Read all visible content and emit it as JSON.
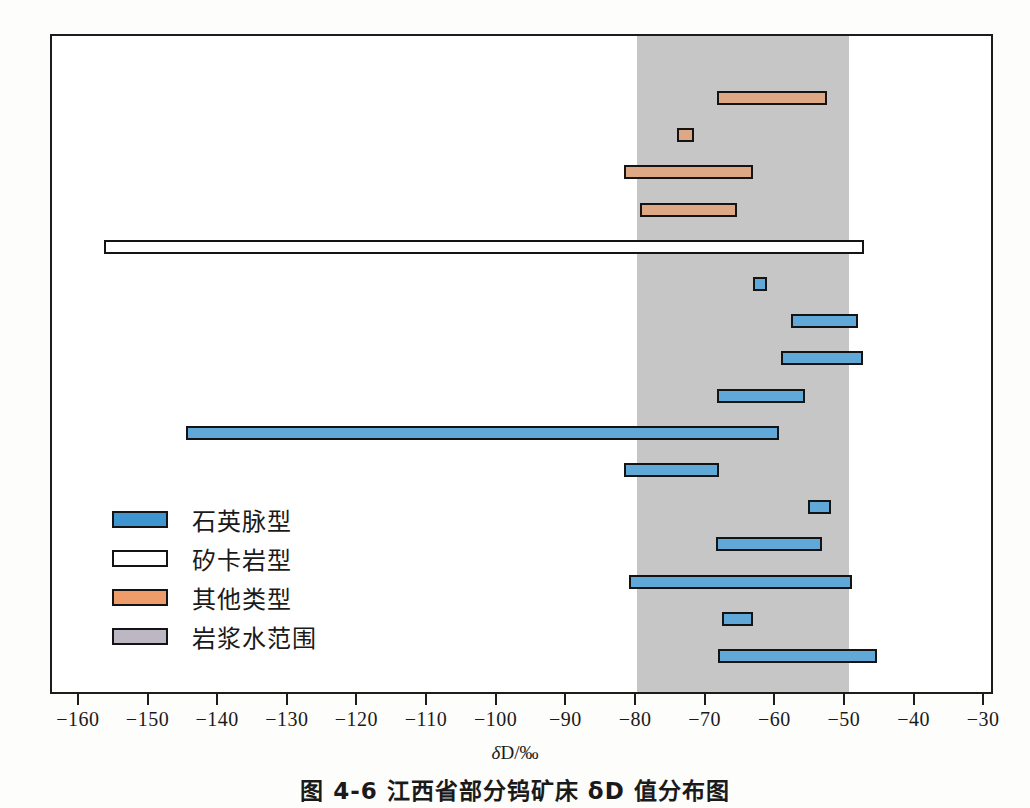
{
  "caption": {
    "prefix": "图 4-6",
    "text": "江西省部分钨矿床 δD 值分布图",
    "full": "图 4-6   江西省部分钨矿床 δD 值分布图"
  },
  "axis": {
    "title": "δD/‰",
    "title_symbol": "δ",
    "title_rest": "D/‰",
    "ticks": [
      "-160",
      "-150",
      "-140",
      "-130",
      "-120",
      "-110",
      "-100",
      "-90",
      "-80",
      "-70",
      "-60",
      "-50",
      "-40",
      "-30"
    ],
    "min": -164.0,
    "max": -28.6,
    "grid": false
  },
  "legend": {
    "position": "inside-lower-left",
    "items": [
      {
        "label": "石英脉型",
        "key": "quartz",
        "color": "#3e95d0"
      },
      {
        "label": "矽卡岩型",
        "key": "skarn",
        "color": "#ffffff"
      },
      {
        "label": "其他类型",
        "key": "other",
        "color": "#ef9c6b"
      },
      {
        "label": "岩浆水范围",
        "key": "magmatic",
        "color": "#bdb7c4"
      }
    ]
  },
  "chart_data": {
    "type": "bar",
    "orientation": "horizontal-range",
    "title": "图 4-6   江西省部分钨矿床 δD 值分布图",
    "xlabel": "δD/‰",
    "ylabel": "",
    "xlim": [
      -164.0,
      -28.6
    ],
    "grid": false,
    "shaded_region": {
      "name": "岩浆水范围",
      "start": -80.0,
      "end": -49.6,
      "color": "#c6c6c6"
    },
    "series": [
      {
        "name": "其他类型",
        "color": "#dda883",
        "bars": [
          {
            "start": -68.5,
            "end": -52.7,
            "row": 1
          },
          {
            "start": -74.2,
            "end": -71.8,
            "row": 2
          },
          {
            "start": -81.8,
            "end": -63.4,
            "row": 3
          },
          {
            "start": -79.6,
            "end": -65.6,
            "row": 4
          }
        ]
      },
      {
        "name": "矽卡岩型",
        "color": "#ffffff",
        "bars": [
          {
            "start": -156.5,
            "end": -47.4,
            "row": 5
          }
        ]
      },
      {
        "name": "石英脉型",
        "color": "#5fa8d8",
        "bars": [
          {
            "start": -63.4,
            "end": -61.4,
            "row": 6
          },
          {
            "start": -57.9,
            "end": -48.3,
            "row": 7
          },
          {
            "start": -59.3,
            "end": -47.5,
            "row": 8
          },
          {
            "start": -68.5,
            "end": -55.9,
            "row": 9
          },
          {
            "start": -144.7,
            "end": -59.6,
            "row": 10
          },
          {
            "start": -81.8,
            "end": -68.3,
            "row": 11
          },
          {
            "start": -55.4,
            "end": -52.1,
            "row": 12
          },
          {
            "start": -68.6,
            "end": -53.4,
            "row": 13
          },
          {
            "start": -81.1,
            "end": -49.2,
            "row": 14
          },
          {
            "start": -67.8,
            "end": -63.3,
            "row": 15
          },
          {
            "start": -68.4,
            "end": -45.6,
            "row": 16
          }
        ]
      }
    ]
  }
}
